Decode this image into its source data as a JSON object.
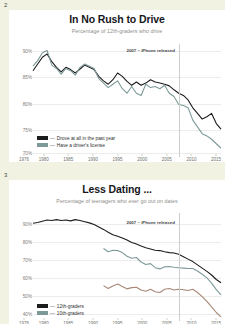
{
  "page": {
    "background_color": "#f2f2e2",
    "card_color": "#ffffff"
  },
  "charts": [
    {
      "page_number": "2",
      "title": "In No Rush to Drive",
      "subtitle": "Percentage of 12th-graders who drive",
      "annotation": "2007 – iPhone released",
      "annotation_year": 2007,
      "legend": [
        {
          "label": "Drove at all in the past year",
          "color": "#1c1c1c",
          "dash": "—"
        },
        {
          "label": "Have a driver's license",
          "color": "#7d9a99",
          "dash": "—"
        }
      ],
      "chart_data": {
        "type": "line",
        "title": "In No Rush to Drive",
        "subtitle": "Percentage of 12th-graders who drive",
        "xlabel": "",
        "ylabel": "",
        "xlim": [
          1976,
          2016
        ],
        "ylim": [
          70,
          91
        ],
        "yticks": [
          "90%",
          "85%",
          "80%",
          "75%",
          "70%"
        ],
        "ytick_values": [
          90,
          85,
          80,
          75,
          70
        ],
        "xticks": [
          "1976",
          "1980",
          "1985",
          "1990",
          "1995",
          "2000",
          "2005",
          "2010",
          "2015"
        ],
        "xtick_values": [
          1976,
          1980,
          1985,
          1990,
          1995,
          2000,
          2005,
          2010,
          2015
        ],
        "grid": false,
        "legend_position": "lower-left",
        "annotations": [
          {
            "text": "2007 – iPhone released",
            "x": 2007,
            "type": "vertical-line"
          }
        ],
        "series": [
          {
            "name": "Drove at all in the past year",
            "color": "#1c1c1c",
            "x": [
              1976,
              1977,
              1978,
              1979,
              1980,
              1981,
              1982,
              1983,
              1984,
              1985,
              1986,
              1987,
              1988,
              1989,
              1990,
              1991,
              1992,
              1993,
              1994,
              1995,
              1996,
              1997,
              1998,
              1999,
              2000,
              2001,
              2002,
              2003,
              2004,
              2005,
              2006,
              2007,
              2008,
              2009,
              2010,
              2011,
              2012,
              2013,
              2014,
              2015,
              2016
            ],
            "values": [
              85.0,
              86.2,
              87.4,
              88.0,
              86.6,
              85.6,
              84.8,
              85.6,
              85.2,
              84.6,
              85.3,
              86.0,
              85.6,
              85.2,
              84.0,
              83.2,
              82.6,
              83.4,
              84.6,
              84.0,
              83.1,
              82.4,
              83.0,
              82.4,
              82.8,
              83.4,
              83.0,
              82.8,
              82.6,
              82.3,
              81.6,
              81.0,
              80.6,
              79.8,
              78.4,
              77.4,
              76.4,
              76.8,
              77.4,
              75.6,
              74.6
            ]
          },
          {
            "name": "Have a driver's license",
            "color": "#7d9a99",
            "x": [
              1976,
              1977,
              1978,
              1979,
              1980,
              1981,
              1982,
              1983,
              1984,
              1985,
              1986,
              1987,
              1988,
              1989,
              1990,
              1991,
              1992,
              1993,
              1994,
              1995,
              1996,
              1997,
              1998,
              1999,
              2000,
              2001,
              2002,
              2003,
              2004,
              2005,
              2006,
              2007,
              2008,
              2009,
              2010,
              2011,
              2012,
              2013,
              2014,
              2015,
              2016
            ],
            "values": [
              85.8,
              86.8,
              88.2,
              88.6,
              86.0,
              85.4,
              84.4,
              85.4,
              85.0,
              84.2,
              85.6,
              86.2,
              85.8,
              85.4,
              83.6,
              82.8,
              82.0,
              82.6,
              83.2,
              81.8,
              81.0,
              82.2,
              81.0,
              80.6,
              82.6,
              82.0,
              82.2,
              81.8,
              82.4,
              81.0,
              80.4,
              79.0,
              78.8,
              78.4,
              76.2,
              75.0,
              73.8,
              73.4,
              72.8,
              72.0,
              71.2
            ]
          }
        ]
      }
    },
    {
      "page_number": "3",
      "title": "Less Dating ...",
      "subtitle": "Percentage of teenagers who ever go out on dates",
      "annotation": "2007 – iPhone released",
      "annotation_year": 2007,
      "legend": [
        {
          "label": "12th-graders",
          "color": "#1c1c1c",
          "dash": "—"
        },
        {
          "label": "10th-graders",
          "color": "#7d9a99",
          "dash": "—"
        }
      ],
      "chart_data": {
        "type": "line",
        "title": "Less Dating ...",
        "subtitle": "Percentage of teenagers who ever go out on dates",
        "xlabel": "",
        "ylabel": "",
        "xlim": [
          1976,
          2016
        ],
        "ylim": [
          38,
          93
        ],
        "yticks": [
          "90%",
          "80%",
          "70%",
          "60%",
          "50%",
          "40%"
        ],
        "ytick_values": [
          90,
          80,
          70,
          60,
          50,
          40
        ],
        "xticks": [
          "1976",
          "1980",
          "1985",
          "1990",
          "1995",
          "2000",
          "2005",
          "2010",
          "2015"
        ],
        "xtick_values": [
          1976,
          1980,
          1985,
          1990,
          1995,
          2000,
          2005,
          2010,
          2015
        ],
        "grid": false,
        "legend_position": "lower-left",
        "annotations": [
          {
            "text": "2007 – iPhone released",
            "x": 2007,
            "type": "vertical-line"
          }
        ],
        "series": [
          {
            "name": "12th-graders",
            "color": "#1c1c1c",
            "x": [
              1976,
              1977,
              1978,
              1979,
              1980,
              1981,
              1982,
              1983,
              1984,
              1985,
              1986,
              1987,
              1988,
              1989,
              1990,
              1991,
              1992,
              1993,
              1994,
              1995,
              1996,
              1997,
              1998,
              1999,
              2000,
              2001,
              2002,
              2003,
              2004,
              2005,
              2006,
              2007,
              2008,
              2009,
              2010,
              2011,
              2012,
              2013,
              2014,
              2015,
              2016
            ],
            "values": [
              85.0,
              85.4,
              86.0,
              86.6,
              86.4,
              86.8,
              86.4,
              86.6,
              86.2,
              86.8,
              86.4,
              85.8,
              85.2,
              84.4,
              83.2,
              82.0,
              80.6,
              79.4,
              78.6,
              77.8,
              76.8,
              75.6,
              74.8,
              73.8,
              73.0,
              72.4,
              71.8,
              71.6,
              71.0,
              70.6,
              70.4,
              69.8,
              68.6,
              67.4,
              66.2,
              64.6,
              63.0,
              61.4,
              59.6,
              57.4,
              55.8
            ]
          },
          {
            "name": "10th-graders",
            "color": "#7d9a99",
            "x": [
              1991,
              1992,
              1993,
              1994,
              1995,
              1996,
              1997,
              1998,
              1999,
              2000,
              2001,
              2002,
              2003,
              2004,
              2005,
              2006,
              2007,
              2008,
              2009,
              2010,
              2011,
              2012,
              2013,
              2014,
              2015,
              2016
            ],
            "values": [
              72.6,
              71.0,
              71.8,
              71.6,
              70.6,
              68.8,
              67.8,
              68.2,
              66.0,
              64.8,
              65.2,
              63.2,
              62.6,
              63.6,
              63.8,
              63.4,
              63.2,
              63.0,
              62.8,
              62.8,
              61.6,
              60.0,
              58.2,
              55.6,
              52.4,
              49.8
            ]
          },
          {
            "name": "8th-graders",
            "color": "#a98878",
            "x": [
              1991,
              1992,
              1993,
              1994,
              1995,
              1996,
              1997,
              1998,
              1999,
              2000,
              2001,
              2002,
              2003,
              2004,
              2005,
              2006,
              2007,
              2008,
              2009,
              2010,
              2011,
              2012,
              2013,
              2014,
              2015,
              2016
            ],
            "values": [
              54.4,
              53.0,
              54.2,
              55.2,
              54.0,
              52.8,
              53.4,
              53.6,
              52.2,
              51.6,
              52.6,
              51.4,
              51.0,
              52.6,
              53.0,
              52.2,
              52.6,
              52.4,
              52.0,
              52.6,
              51.0,
              49.0,
              46.6,
              44.0,
              41.2,
              39.0
            ]
          }
        ]
      }
    }
  ]
}
